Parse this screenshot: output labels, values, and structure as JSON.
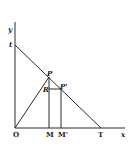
{
  "diagram": {
    "type": "geometry",
    "axes": {
      "x_label": "x",
      "y_label": "y",
      "origin_label": "O"
    },
    "points": {
      "t": {
        "label": "t"
      },
      "P": {
        "label": "P"
      },
      "P_prime": {
        "label": "P'"
      },
      "R": {
        "label": "R"
      },
      "M": {
        "label": "M"
      },
      "M_prime": {
        "label": "M'"
      },
      "T": {
        "label": "T"
      }
    },
    "segments": [
      "tT",
      "OP",
      "PM",
      "P'M'",
      "RP'"
    ],
    "colors": {
      "ink": "#2a2a2a",
      "background": "#ffffff"
    }
  }
}
